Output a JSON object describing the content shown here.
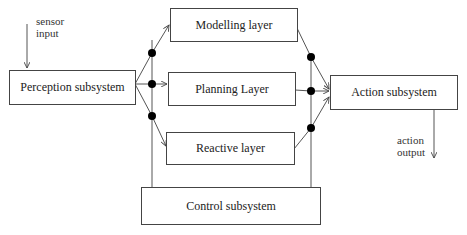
{
  "diagram": {
    "type": "layered-architecture",
    "nodes": {
      "perception": {
        "label": "Perception subsystem"
      },
      "modelling": {
        "label": "Modelling layer"
      },
      "planning": {
        "label": "Planning Layer"
      },
      "reactive": {
        "label": "Reactive layer"
      },
      "action": {
        "label": "Action subsystem"
      },
      "control": {
        "label": "Control subsystem"
      }
    },
    "io_labels": {
      "sensor_input_line1": "sensor",
      "sensor_input_line2": "input",
      "action_output_line1": "action",
      "action_output_line2": "output"
    },
    "edges": [
      {
        "from": "sensor input",
        "to": "perception"
      },
      {
        "from": "perception",
        "to": "modelling"
      },
      {
        "from": "perception",
        "to": "planning"
      },
      {
        "from": "perception",
        "to": "reactive"
      },
      {
        "from": "modelling",
        "to": "action"
      },
      {
        "from": "planning",
        "to": "action"
      },
      {
        "from": "reactive",
        "to": "action"
      },
      {
        "from": "control",
        "to": "left junction"
      },
      {
        "from": "control",
        "to": "right junction"
      },
      {
        "from": "action",
        "to": "action output"
      }
    ],
    "colors": {
      "line": "#444444",
      "junction": "#000000",
      "box_border": "#444444"
    }
  }
}
